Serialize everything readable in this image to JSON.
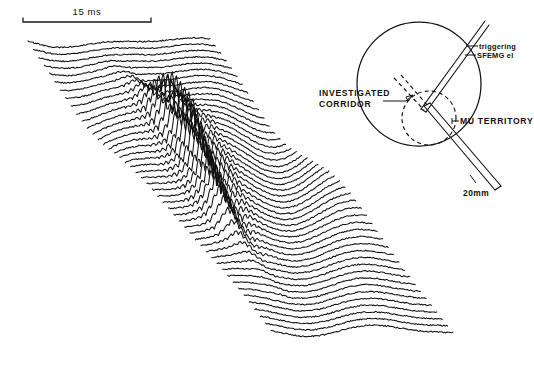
{
  "figure": {
    "background_color": "#ffffff",
    "ink_color": "#111111"
  },
  "time_scale": {
    "label": "15 ms",
    "value": 15,
    "units": "ms",
    "bar_x_start": 23,
    "bar_x_end": 151,
    "bar_y": 22
  },
  "spatial_scale": {
    "label": "20mm",
    "value": 20,
    "units": "mm"
  },
  "diagram": {
    "labels": {
      "triggering_electrode_line1": "triggering",
      "triggering_electrode_line2": "SFEMG el",
      "investigated_corridor_line1": "INVESTIGATED",
      "investigated_corridor_line2": "CORRIDOR",
      "mu_territory": "MU  TERRITORY"
    },
    "muscle_circle": {
      "cx": 419,
      "cy": 84,
      "r": 62
    },
    "mu_territory_circle": {
      "cx": 429,
      "cy": 118,
      "r": 27
    }
  },
  "chart_data": {
    "type": "line",
    "subtitle": "Sequential motor unit potentials recorded along the electrode corridor",
    "xlabel": "time",
    "ylabel": "recording position along corridor",
    "grid": false,
    "legend": null,
    "x_scale_label": "15 ms",
    "n_traces": 46,
    "trace_spacing_px": {
      "dx": 5.4,
      "dy": 6.5
    },
    "origin_px": {
      "x": 28,
      "y": 40
    },
    "trace_length_px": 182,
    "amplitude_profile_note": "Amplitude near zero for outer traces, maximal (spiky, multi-phasic) for traces 14-30 crossing the motor unit territory",
    "series": [
      {
        "name": "trace-1",
        "amp": 0.06,
        "spike": 0.0,
        "phase": 0.1
      },
      {
        "name": "trace-2",
        "amp": 0.08,
        "spike": 0.0,
        "phase": 0.25
      },
      {
        "name": "trace-3",
        "amp": 0.11,
        "spike": 0.0,
        "phase": 0.4
      },
      {
        "name": "trace-4",
        "amp": 0.14,
        "spike": 0.02,
        "phase": 0.55
      },
      {
        "name": "trace-5",
        "amp": 0.18,
        "spike": 0.04,
        "phase": 0.7
      },
      {
        "name": "trace-6",
        "amp": 0.22,
        "spike": 0.06,
        "phase": 0.85
      },
      {
        "name": "trace-7",
        "amp": 0.28,
        "spike": 0.1,
        "phase": 1.0
      },
      {
        "name": "trace-8",
        "amp": 0.34,
        "spike": 0.16,
        "phase": 1.15
      },
      {
        "name": "trace-9",
        "amp": 0.42,
        "spike": 0.26,
        "phase": 1.3
      },
      {
        "name": "trace-10",
        "amp": 0.52,
        "spike": 0.42,
        "phase": 1.45
      },
      {
        "name": "trace-11",
        "amp": 0.62,
        "spike": 0.62,
        "phase": 1.6
      },
      {
        "name": "trace-12",
        "amp": 0.7,
        "spike": 0.8,
        "phase": 1.75
      },
      {
        "name": "trace-13",
        "amp": 0.78,
        "spike": 0.95,
        "phase": 1.9
      },
      {
        "name": "trace-14",
        "amp": 0.86,
        "spike": 1.0,
        "phase": 2.05
      },
      {
        "name": "trace-15",
        "amp": 0.92,
        "spike": 0.96,
        "phase": 2.2
      },
      {
        "name": "trace-16",
        "amp": 0.95,
        "spike": 0.9,
        "phase": 2.35
      },
      {
        "name": "trace-17",
        "amp": 0.97,
        "spike": 0.88,
        "phase": 2.5
      },
      {
        "name": "trace-18",
        "amp": 1.0,
        "spike": 0.92,
        "phase": 2.65
      },
      {
        "name": "trace-19",
        "amp": 0.98,
        "spike": 0.97,
        "phase": 2.8
      },
      {
        "name": "trace-20",
        "amp": 0.94,
        "spike": 1.0,
        "phase": 2.95
      },
      {
        "name": "trace-21",
        "amp": 0.9,
        "spike": 0.98,
        "phase": 3.1
      },
      {
        "name": "trace-22",
        "amp": 0.86,
        "spike": 0.94,
        "phase": 3.25
      },
      {
        "name": "trace-23",
        "amp": 0.82,
        "spike": 0.9,
        "phase": 3.4
      },
      {
        "name": "trace-24",
        "amp": 0.78,
        "spike": 0.86,
        "phase": 3.55
      },
      {
        "name": "trace-25",
        "amp": 0.74,
        "spike": 0.82,
        "phase": 3.7
      },
      {
        "name": "trace-26",
        "amp": 0.7,
        "spike": 0.76,
        "phase": 3.85
      },
      {
        "name": "trace-27",
        "amp": 0.64,
        "spike": 0.7,
        "phase": 4.0
      },
      {
        "name": "trace-28",
        "amp": 0.58,
        "spike": 0.62,
        "phase": 4.15
      },
      {
        "name": "trace-29",
        "amp": 0.52,
        "spike": 0.54,
        "phase": 4.3
      },
      {
        "name": "trace-30",
        "amp": 0.46,
        "spike": 0.44,
        "phase": 4.45
      },
      {
        "name": "trace-31",
        "amp": 0.4,
        "spike": 0.34,
        "phase": 4.6
      },
      {
        "name": "trace-32",
        "amp": 0.36,
        "spike": 0.26,
        "phase": 4.75
      },
      {
        "name": "trace-33",
        "amp": 0.32,
        "spike": 0.2,
        "phase": 4.9
      },
      {
        "name": "trace-34",
        "amp": 0.29,
        "spike": 0.15,
        "phase": 5.05
      },
      {
        "name": "trace-35",
        "amp": 0.26,
        "spike": 0.11,
        "phase": 5.2
      },
      {
        "name": "trace-36",
        "amp": 0.23,
        "spike": 0.08,
        "phase": 5.35
      },
      {
        "name": "trace-37",
        "amp": 0.21,
        "spike": 0.06,
        "phase": 5.5
      },
      {
        "name": "trace-38",
        "amp": 0.19,
        "spike": 0.04,
        "phase": 5.65
      },
      {
        "name": "trace-39",
        "amp": 0.17,
        "spike": 0.03,
        "phase": 5.8
      },
      {
        "name": "trace-40",
        "amp": 0.15,
        "spike": 0.02,
        "phase": 5.95
      },
      {
        "name": "trace-41",
        "amp": 0.13,
        "spike": 0.01,
        "phase": 6.1
      },
      {
        "name": "trace-42",
        "amp": 0.11,
        "spike": 0.0,
        "phase": 6.25
      },
      {
        "name": "trace-43",
        "amp": 0.1,
        "spike": 0.0,
        "phase": 6.4
      },
      {
        "name": "trace-44",
        "amp": 0.08,
        "spike": 0.0,
        "phase": 6.55
      },
      {
        "name": "trace-45",
        "amp": 0.07,
        "spike": 0.0,
        "phase": 6.7
      },
      {
        "name": "trace-46",
        "amp": 0.06,
        "spike": 0.0,
        "phase": 6.85
      }
    ]
  }
}
